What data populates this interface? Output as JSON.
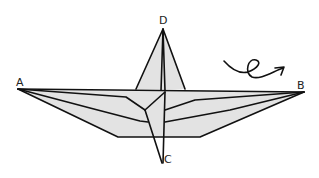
{
  "diagram": {
    "type": "origami-fold-diagram",
    "points": {
      "A": {
        "label": "A",
        "x": 18,
        "y": 89
      },
      "B": {
        "label": "B",
        "x": 304,
        "y": 92
      },
      "C": {
        "label": "C",
        "x": 162,
        "y": 163
      },
      "D": {
        "label": "D",
        "x": 163,
        "y": 29
      }
    },
    "annotations": [
      {
        "name": "turn-over-arrow",
        "meaning": "turn the model over"
      }
    ],
    "colors": {
      "paper_fill": "#e3e3e3",
      "line": "#111111",
      "background": "#ffffff"
    }
  }
}
